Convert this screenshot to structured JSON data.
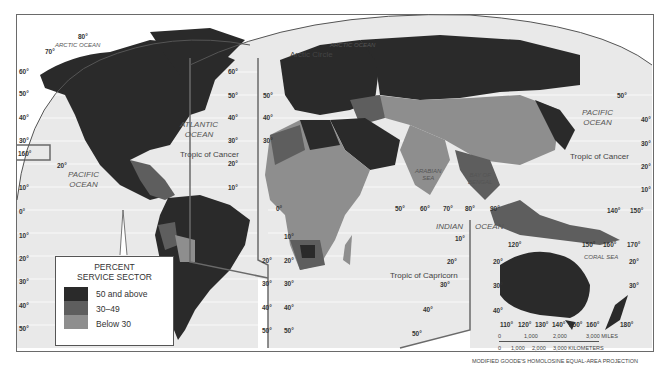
{
  "map": {
    "title": "",
    "projection": "MODIFIED GOODE'S HOMOLOSINE EQUAL-AREA PROJECTION",
    "colors": {
      "ocean": "#e9e9e9",
      "high": "#2a2a2a",
      "mid": "#5e5e5e",
      "low": "#8e8e8e",
      "frame": "#6a6a6a"
    }
  },
  "legend": {
    "title_line1": "PERCENT",
    "title_line2": "SERVICE SECTOR",
    "items": [
      {
        "label": "50 and above",
        "color": "#2a2a2a"
      },
      {
        "label": "30–49",
        "color": "#5e5e5e"
      },
      {
        "label": "Below 30",
        "color": "#8e8e8e"
      }
    ]
  },
  "labels": {
    "arctic_ocean_left": "ARCTIC OCEAN",
    "arctic_ocean_right": "ARCTIC OCEAN",
    "arctic_circle": "Arctic Circle",
    "atlantic_ocean_1": "ATLANTIC",
    "atlantic_ocean_2": "OCEAN",
    "pacific_ocean_left_1": "PACIFIC",
    "pacific_ocean_left_2": "OCEAN",
    "pacific_ocean_right_1": "PACIFIC",
    "pacific_ocean_right_2": "OCEAN",
    "indian_ocean_1": "INDIAN",
    "indian_ocean_2": "OCEAN",
    "arabian_sea_1": "ARABIAN",
    "arabian_sea_2": "SEA",
    "bay_of_bengal_1": "BAY OF",
    "bay_of_bengal_2": "BENGAL",
    "coral_sea": "CORAL SEA",
    "tropic_cancer_left": "Tropic of Cancer",
    "tropic_cancer_right": "Tropic of Cancer",
    "tropic_capricorn": "Tropic of Capricorn"
  },
  "degrees": {
    "left_lat": [
      "60°",
      "50°",
      "40°",
      "30°",
      "20°",
      "10°",
      "0°",
      "10°",
      "20°",
      "30°",
      "40°",
      "50°"
    ],
    "mid_lat_left": [
      "60°",
      "50°",
      "40°",
      "30°",
      "20°",
      "10°"
    ],
    "mid_lat_right": [
      "50°",
      "40°",
      "30°",
      "20°",
      "10°",
      "0°",
      "10°",
      "20°",
      "30°",
      "40°",
      "50°"
    ],
    "lon_top_left": [
      "80°",
      "70°"
    ],
    "hawaii_lon": "160°",
    "hawaii_lat": "20°",
    "indian_lon": [
      "50°",
      "60°",
      "70°",
      "80°",
      "90°"
    ],
    "indian_lat": [
      "10°",
      "20°",
      "30°",
      "40°",
      "50°"
    ],
    "right_lat": [
      "50°",
      "40°",
      "30°",
      "20°",
      "10°"
    ],
    "pacific_lon": [
      "140°",
      "150°"
    ],
    "inset_top": [
      "120°",
      "150°",
      "160°",
      "170°"
    ],
    "inset_bottom": [
      "110°",
      "120°",
      "130°",
      "140°",
      "150°",
      "160°",
      "180°"
    ],
    "inset_left": [
      "20°",
      "30°",
      "40°"
    ],
    "inset_right": [
      "20°",
      "30°"
    ]
  },
  "scale_bar": {
    "miles": [
      "0",
      "1,000",
      "2,000",
      "3,000 MILES"
    ],
    "km": [
      "0",
      "1,000",
      "2,000",
      "3,000 KILOMETERS"
    ]
  }
}
